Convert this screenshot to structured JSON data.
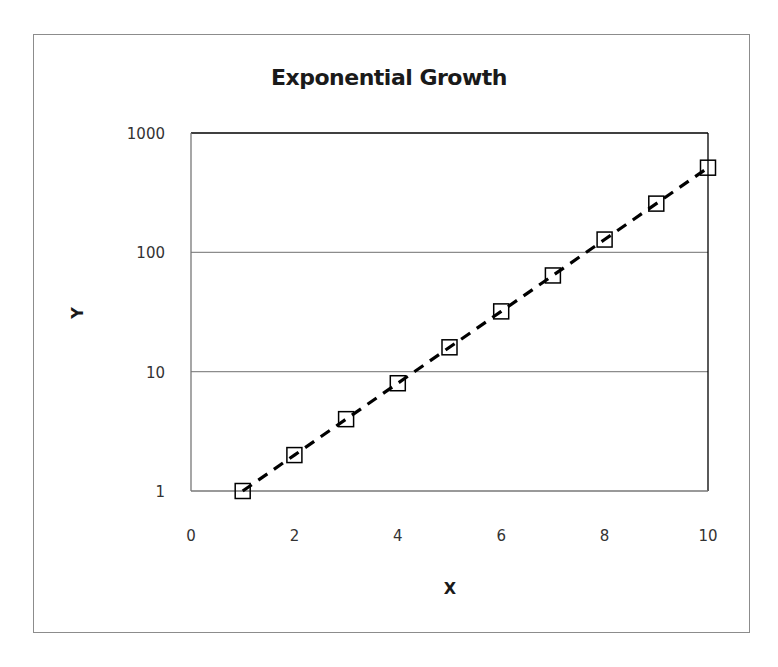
{
  "chart_data": {
    "type": "scatter",
    "title": "Exponential Growth",
    "xlabel": "X",
    "ylabel": "Y",
    "xlim": [
      0,
      10
    ],
    "ylim": [
      1,
      1000
    ],
    "yscale": "log",
    "x_ticks": [
      0,
      2,
      4,
      6,
      8,
      10
    ],
    "y_ticks": [
      1,
      10,
      100,
      1000
    ],
    "grid": {
      "horizontal": true,
      "vertical": false
    },
    "legend": null,
    "series": [
      {
        "name": "Y",
        "marker": "open-square",
        "line": "dashed",
        "color": "#000000",
        "x": [
          1,
          2,
          3,
          4,
          5,
          6,
          7,
          8,
          9,
          10
        ],
        "values": [
          1,
          2,
          4,
          8,
          16,
          32,
          64,
          128,
          256,
          512
        ]
      }
    ]
  },
  "labels": {
    "title": "Exponential Growth",
    "xlabel": "X",
    "ylabel": "Y",
    "x_ticks": [
      "0",
      "2",
      "4",
      "6",
      "8",
      "10"
    ],
    "y_ticks": [
      "1",
      "10",
      "100",
      "1000"
    ]
  },
  "colors": {
    "frame": "#8c8c8c",
    "plot_border": "#000000",
    "gridline": "#8c8c8c",
    "series": "#000000"
  }
}
